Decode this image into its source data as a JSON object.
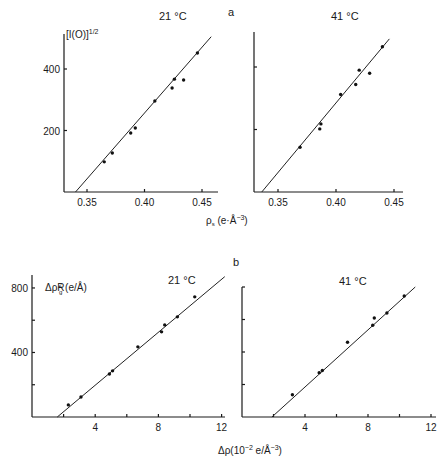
{
  "figure": {
    "panel_a_label": "a",
    "panel_b_label": "b"
  },
  "chart_data": [
    {
      "id": "a-left",
      "panel": "a",
      "type": "scatter",
      "title": "21 °C",
      "ylabel": "[I(O)]^1/2",
      "xlabel": "ρs (e·Å⁻³)",
      "xlim": [
        0.33,
        0.46
      ],
      "ylim": [
        0,
        500
      ],
      "xticks": [
        0.35,
        0.4,
        0.45
      ],
      "xtick_labels": [
        "0.35",
        "0.40",
        "0.45"
      ],
      "yticks": [
        200,
        400
      ],
      "ytick_labels": [
        "200",
        "400"
      ],
      "grid": false,
      "points": [
        {
          "x": 0.365,
          "y": 98
        },
        {
          "x": 0.372,
          "y": 127
        },
        {
          "x": 0.388,
          "y": 192
        },
        {
          "x": 0.392,
          "y": 208
        },
        {
          "x": 0.409,
          "y": 296
        },
        {
          "x": 0.424,
          "y": 338
        },
        {
          "x": 0.426,
          "y": 367
        },
        {
          "x": 0.434,
          "y": 364
        },
        {
          "x": 0.446,
          "y": 452
        }
      ],
      "fit_line": {
        "x0": 0.34,
        "y0": 0,
        "x1": 0.458,
        "y1": 505
      }
    },
    {
      "id": "a-right",
      "panel": "a",
      "type": "scatter",
      "title": "41 °C",
      "ylabel": "",
      "xlabel": "",
      "xlim": [
        0.33,
        0.46
      ],
      "ylim": [
        0,
        500
      ],
      "xticks": [
        0.35,
        0.4,
        0.45
      ],
      "xtick_labels": [
        "0.35",
        "0.40",
        "0.45"
      ],
      "yticks": [
        200,
        400
      ],
      "ytick_labels": [
        "",
        ""
      ],
      "grid": false,
      "points": [
        {
          "x": 0.369,
          "y": 143
        },
        {
          "x": 0.386,
          "y": 202
        },
        {
          "x": 0.387,
          "y": 218
        },
        {
          "x": 0.404,
          "y": 312
        },
        {
          "x": 0.417,
          "y": 344
        },
        {
          "x": 0.42,
          "y": 390
        },
        {
          "x": 0.429,
          "y": 380
        },
        {
          "x": 0.44,
          "y": 465
        }
      ],
      "fit_line": {
        "x0": 0.336,
        "y0": 0,
        "x1": 0.446,
        "y1": 490
      }
    },
    {
      "id": "b-left",
      "panel": "b",
      "type": "scatter",
      "title": "21 °C",
      "ylabel": "ΔρRg² (e/Å)",
      "xlabel": "Δρ(10⁻² e/Å⁻³)",
      "xlim": [
        0,
        12.3
      ],
      "ylim": [
        0,
        880
      ],
      "xticks": [
        2,
        4,
        6,
        8,
        10,
        12
      ],
      "xtick_labels": [
        "",
        "4",
        "",
        "8",
        "",
        "12"
      ],
      "yticks": [
        200,
        400,
        600,
        800
      ],
      "ytick_labels": [
        "",
        "400",
        "",
        "800"
      ],
      "grid": false,
      "points": [
        {
          "x": 2.3,
          "y": 75
        },
        {
          "x": 3.1,
          "y": 124
        },
        {
          "x": 4.9,
          "y": 267
        },
        {
          "x": 5.1,
          "y": 286
        },
        {
          "x": 6.7,
          "y": 435
        },
        {
          "x": 8.2,
          "y": 528
        },
        {
          "x": 8.4,
          "y": 571
        },
        {
          "x": 9.2,
          "y": 621
        },
        {
          "x": 10.3,
          "y": 745
        }
      ],
      "fit_line": {
        "x0": 1.6,
        "y0": 0,
        "x1": 12.2,
        "y1": 870
      }
    },
    {
      "id": "b-right",
      "panel": "b",
      "type": "scatter",
      "title": "41 °C",
      "ylabel": "",
      "xlabel": "",
      "xlim": [
        0,
        12.3
      ],
      "ylim": [
        0,
        880
      ],
      "xticks": [
        2,
        4,
        6,
        8,
        10,
        12
      ],
      "xtick_labels": [
        "",
        "4",
        "",
        "8",
        "",
        "12"
      ],
      "yticks": [
        200,
        400,
        600,
        800
      ],
      "ytick_labels": [
        "",
        "",
        "",
        ""
      ],
      "grid": false,
      "points": [
        {
          "x": 3.2,
          "y": 137
        },
        {
          "x": 4.9,
          "y": 273
        },
        {
          "x": 5.1,
          "y": 286
        },
        {
          "x": 6.7,
          "y": 460
        },
        {
          "x": 8.3,
          "y": 565
        },
        {
          "x": 8.4,
          "y": 609
        },
        {
          "x": 9.2,
          "y": 640
        },
        {
          "x": 10.3,
          "y": 745
        }
      ],
      "fit_line": {
        "x0": 1.9,
        "y0": 0,
        "x1": 11.0,
        "y1": 800
      }
    }
  ]
}
